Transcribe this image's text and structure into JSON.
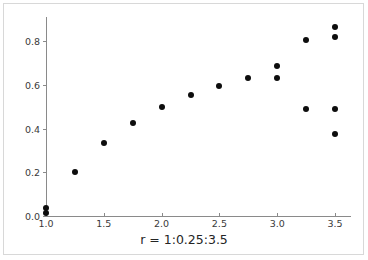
{
  "figure": {
    "background_color": "#ffffff",
    "frame_color": "#d8d8d8",
    "axis_color": "#8a8a8a",
    "marker_color": "#0d0d0d"
  },
  "chart_data": {
    "type": "scatter",
    "title": "",
    "subtitle": "",
    "xlabel": "r = 1:0.25:3.5",
    "ylabel": "",
    "xlim": [
      0.9,
      3.64
    ],
    "ylim": [
      -0.03,
      0.9
    ],
    "grid": false,
    "legend": null,
    "legend_position": "none",
    "xticks": [
      1.0,
      1.5,
      2.0,
      2.5,
      3.0,
      3.5
    ],
    "xtick_labels": [
      "1.0",
      "1.5",
      "2.0",
      "2.5",
      "3.0",
      "3.5"
    ],
    "yticks": [
      0.0,
      0.2,
      0.4,
      0.6,
      0.8
    ],
    "ytick_labels": [
      "0.0",
      "0.2",
      "0.4",
      "0.6",
      "0.8"
    ],
    "marker": "filled-circle",
    "marker_size_px": 6,
    "annotations": [],
    "series": [
      {
        "name": "points",
        "points": [
          {
            "x": 1.0,
            "y": 0.015
          },
          {
            "x": 1.0,
            "y": 0.035
          },
          {
            "x": 1.25,
            "y": 0.2
          },
          {
            "x": 1.5,
            "y": 0.335
          },
          {
            "x": 1.75,
            "y": 0.425
          },
          {
            "x": 2.0,
            "y": 0.498
          },
          {
            "x": 2.25,
            "y": 0.553
          },
          {
            "x": 2.5,
            "y": 0.595
          },
          {
            "x": 2.75,
            "y": 0.63
          },
          {
            "x": 3.0,
            "y": 0.685
          },
          {
            "x": 3.0,
            "y": 0.63
          },
          {
            "x": 3.25,
            "y": 0.805
          },
          {
            "x": 3.25,
            "y": 0.488
          },
          {
            "x": 3.5,
            "y": 0.865
          },
          {
            "x": 3.5,
            "y": 0.818
          },
          {
            "x": 3.5,
            "y": 0.49
          },
          {
            "x": 3.5,
            "y": 0.375
          }
        ]
      }
    ]
  }
}
